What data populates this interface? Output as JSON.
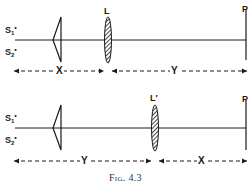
{
  "figure": {
    "caption": "Fig. 4.3",
    "stroke_color": "#1a1a1a"
  },
  "top_setup": {
    "source_1": {
      "letter": "S",
      "subscript": "1",
      "mark": "•"
    },
    "source_2": {
      "letter": "S",
      "subscript": "2",
      "mark": "•"
    },
    "lens_label": "L",
    "screen_label": "P",
    "distance_prism_to_lens": "X",
    "distance_lens_to_screen": "Y"
  },
  "bottom_setup": {
    "source_1": {
      "letter": "S",
      "subscript": "1",
      "mark": "•"
    },
    "source_2": {
      "letter": "S",
      "subscript": "2",
      "mark": "•"
    },
    "lens_label": "L′",
    "screen_label": "P",
    "distance_prism_to_lens": "Y",
    "distance_lens_to_screen": "X"
  }
}
